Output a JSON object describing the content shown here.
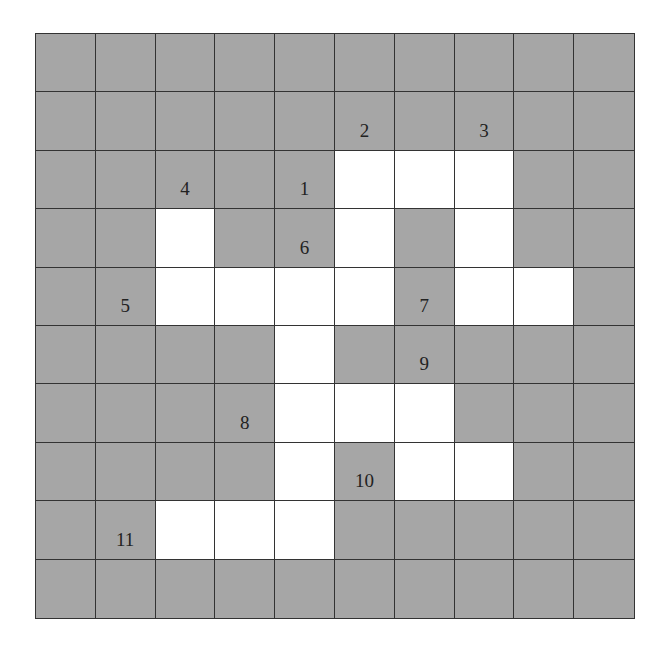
{
  "puzzle": {
    "type": "arrow-crossword",
    "rows": 10,
    "cols": 10,
    "colors": {
      "block": "#a6a6a6",
      "open": "#ffffff",
      "line": "#333333"
    },
    "layout": [
      "##########",
      "##########",
      "#####...##",
      "##.##.#.##",
      "##....#..#",
      "####.#####",
      "####...###",
      "####.#..##",
      "##...#####",
      "##########"
    ],
    "clues": [
      {
        "number": "1",
        "row": 2,
        "col": 4
      },
      {
        "number": "2",
        "row": 1,
        "col": 5
      },
      {
        "number": "3",
        "row": 1,
        "col": 7
      },
      {
        "number": "4",
        "row": 2,
        "col": 2
      },
      {
        "number": "5",
        "row": 4,
        "col": 1
      },
      {
        "number": "6",
        "row": 3,
        "col": 4
      },
      {
        "number": "7",
        "row": 4,
        "col": 6
      },
      {
        "number": "8",
        "row": 6,
        "col": 3
      },
      {
        "number": "9",
        "row": 5,
        "col": 6
      },
      {
        "number": "10",
        "row": 7,
        "col": 5
      },
      {
        "number": "11",
        "row": 8,
        "col": 1
      }
    ]
  }
}
